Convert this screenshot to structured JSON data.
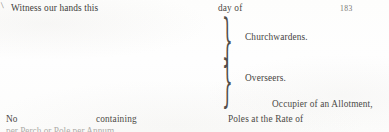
{
  "document": {
    "kind": "scanned-printed-form-fragment",
    "page_number": "183",
    "background_color": "#fefefe",
    "ink_color": "#4a4845"
  },
  "marks": {
    "stray_mark_glyph": "\\"
  },
  "lines": {
    "witness": "Witness our hands this",
    "day_of": "day of",
    "no": "No",
    "containing": "containing",
    "occupier": "Occupier of an Allotment,",
    "poles": "Poles at the Rate of",
    "clipped_bottom": "per Perch or Pole per Annum"
  },
  "braces": [
    {
      "name": "churchwardens",
      "glyph": "}",
      "label": "Churchwardens."
    },
    {
      "name": "overseers",
      "glyph": "}",
      "label": "Overseers."
    }
  ]
}
